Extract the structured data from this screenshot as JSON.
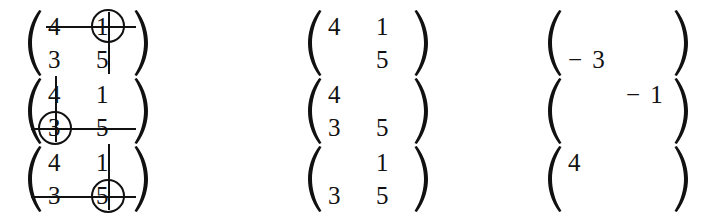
{
  "figure": {
    "ink_color": "#111111",
    "background_color": "#ffffff",
    "columns": [
      {
        "name": "original-with-crossout"
      },
      {
        "name": "minor-matrix"
      },
      {
        "name": "signed-cofactor"
      }
    ],
    "rows": [
      {
        "id": "row-1",
        "original": {
          "entries": {
            "r1c1": "4",
            "r1c2": "1",
            "r2c1": "3",
            "r2c2": "5"
          },
          "circled_entry": "r1c2",
          "circled_value": "1",
          "struck_row": 1,
          "struck_column": 2
        },
        "minor": {
          "entries": {
            "r1c1": "4",
            "r1c2": "1",
            "r2c1": "",
            "r2c2": "5"
          }
        },
        "cofactor": {
          "entries": {
            "r1c1": "",
            "r1c2": "",
            "r2c1": "− 3",
            "r2c2": ""
          },
          "value": "-3"
        }
      },
      {
        "id": "row-2",
        "original": {
          "entries": {
            "r1c1": "4",
            "r1c2": "1",
            "r2c1": "3",
            "r2c2": "5"
          },
          "circled_entry": "r2c1",
          "circled_value": "3",
          "struck_row": 2,
          "struck_column": 1
        },
        "minor": {
          "entries": {
            "r1c1": "4",
            "r1c2": "",
            "r2c1": "3",
            "r2c2": "5"
          }
        },
        "cofactor": {
          "entries": {
            "r1c1": "",
            "r1c2": "− 1",
            "r2c1": "",
            "r2c2": ""
          },
          "value": "-1"
        }
      },
      {
        "id": "row-3",
        "original": {
          "entries": {
            "r1c1": "4",
            "r1c2": "1",
            "r2c1": "3",
            "r2c2": "5"
          },
          "circled_entry": "r2c2",
          "circled_value": "5",
          "struck_row": 2,
          "struck_column": 2
        },
        "minor": {
          "entries": {
            "r1c1": "",
            "r1c2": "1",
            "r2c1": "3",
            "r2c2": "5"
          }
        },
        "cofactor": {
          "entries": {
            "r1c1": "4",
            "r1c2": "",
            "r2c1": "",
            "r2c2": ""
          },
          "value": "4"
        }
      }
    ]
  }
}
